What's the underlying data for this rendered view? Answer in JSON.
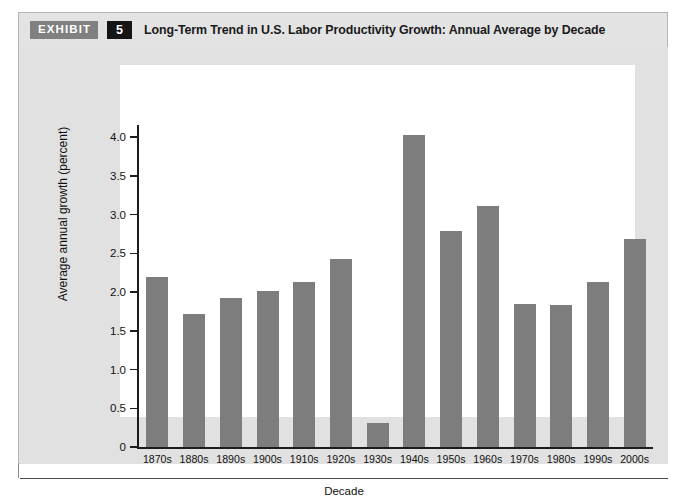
{
  "exhibit": {
    "badge_label": "EXHIBIT",
    "number": "5",
    "title": "Long-Term Trend in U.S. Labor Productivity Growth: Annual Average by Decade"
  },
  "colors": {
    "bar": "#7d7d7d",
    "axis": "#1c1c1c",
    "plot_background": "#ffffff",
    "frame_background": "#e3e3e3",
    "badge_exhibit_bg": "#808080",
    "badge_number_bg": "#151515"
  },
  "chart_data": {
    "type": "bar",
    "title": "Long-Term Trend in U.S. Labor Productivity Growth: Annual Average by Decade",
    "xlabel": "Decade",
    "ylabel": "Average annual growth (percent)",
    "categories": [
      "1870s",
      "1880s",
      "1890s",
      "1900s",
      "1910s",
      "1920s",
      "1930s",
      "1940s",
      "1950s",
      "1960s",
      "1970s",
      "1980s",
      "1990s",
      "2000s"
    ],
    "values": [
      2.2,
      1.71,
      1.92,
      2.01,
      2.13,
      2.42,
      0.31,
      4.02,
      2.79,
      3.11,
      1.84,
      1.83,
      2.13,
      2.68
    ],
    "ylim": [
      0,
      4.0
    ],
    "ytick_values": [
      0,
      0.5,
      1.0,
      1.5,
      2.0,
      2.5,
      3.0,
      3.5,
      4.0
    ],
    "ytick_labels": [
      "0",
      "0.5",
      "1.0",
      "1.5",
      "2.0",
      "2.5",
      "3.0",
      "3.5",
      "4.0"
    ],
    "grid": false,
    "legend": false
  }
}
